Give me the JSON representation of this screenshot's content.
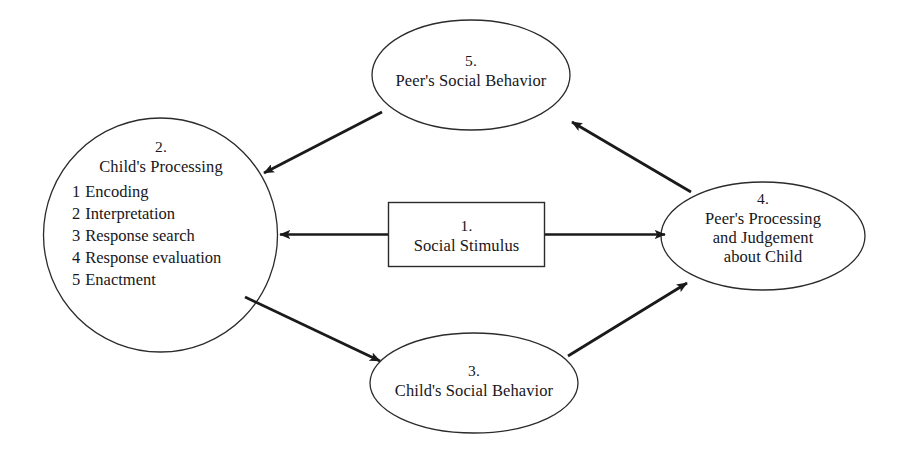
{
  "diagram": {
    "background_color": "#ffffff",
    "stroke_color": "#1a1a1a",
    "shape_stroke_color": "#2b2b2b",
    "text_color": "#17161a",
    "nodes": {
      "stimulus": {
        "shape": "rectangle",
        "number": "1.",
        "title": "Social Stimulus"
      },
      "child_processing": {
        "shape": "circle",
        "number": "2.",
        "title": "Child's Processing",
        "steps": [
          {
            "num": "1",
            "label": "Encoding"
          },
          {
            "num": "2",
            "label": "Interpretation"
          },
          {
            "num": "3",
            "label": "Response search"
          },
          {
            "num": "4",
            "label": "Response evaluation"
          },
          {
            "num": "5",
            "label": "Enactment"
          }
        ]
      },
      "child_behavior": {
        "shape": "ellipse",
        "number": "3.",
        "title": "Child's Social Behavior"
      },
      "peer_processing": {
        "shape": "ellipse",
        "number": "4.",
        "line1": "Peer's Processing",
        "line2": "and Judgement",
        "line3": "about Child"
      },
      "peer_behavior": {
        "shape": "ellipse",
        "number": "5.",
        "title": "Peer's Social Behavior"
      }
    },
    "arrows": [
      {
        "name": "stimulus-to-child-processing",
        "from": "stimulus",
        "to": "child_processing",
        "direction": "left"
      },
      {
        "name": "stimulus-to-peer-processing",
        "from": "stimulus",
        "to": "peer_processing",
        "direction": "right"
      },
      {
        "name": "child-processing-to-child-behavior",
        "from": "child_processing",
        "to": "child_behavior",
        "direction": "down-right"
      },
      {
        "name": "child-behavior-to-peer-processing",
        "from": "child_behavior",
        "to": "peer_processing",
        "direction": "up-right"
      },
      {
        "name": "peer-processing-to-peer-behavior",
        "from": "peer_processing",
        "to": "peer_behavior",
        "direction": "up-left"
      },
      {
        "name": "peer-behavior-to-child-processing",
        "from": "peer_behavior",
        "to": "child_processing",
        "direction": "down-left"
      }
    ]
  }
}
